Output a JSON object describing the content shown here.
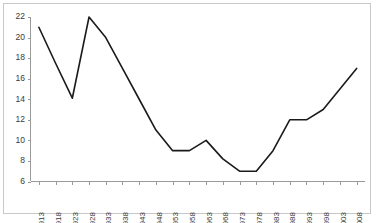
{
  "chart_data": {
    "type": "line",
    "title": "",
    "subtitle": "",
    "xlabel": "",
    "ylabel": "",
    "grid": false,
    "legend": false,
    "legend_position": "none",
    "line_color": "#1a1a1a",
    "axis_color": "#9a9a9a",
    "border_color": "#c8c8c8",
    "background_color": "#ffffff",
    "xlim": [
      1913,
      2008
    ],
    "ylim": [
      6,
      22
    ],
    "ytick_values": [
      6,
      8,
      10,
      12,
      14,
      16,
      18,
      20,
      22
    ],
    "ytick_labels": [
      "6",
      "8",
      "10",
      "12",
      "14",
      "16",
      "18",
      "20",
      "22"
    ],
    "categories": [
      1913,
      1918,
      1923,
      1928,
      1933,
      1938,
      1943,
      1948,
      1953,
      1958,
      1963,
      1968,
      1973,
      1978,
      1983,
      1988,
      1993,
      1998,
      2003,
      2008
    ],
    "xtick_labels": [
      "1913",
      "1918",
      "1923",
      "1928",
      "1933",
      "1938",
      "1943",
      "1948",
      "1953",
      "1958",
      "1963",
      "1968",
      "1973",
      "1978",
      "1983",
      "1988",
      "1993",
      "1998",
      "2003",
      "2008"
    ],
    "values": [
      21,
      17.5,
      14.1,
      22,
      20,
      17,
      14,
      11,
      9,
      9,
      10,
      8.2,
      7,
      7,
      9,
      12,
      12,
      13,
      15,
      17
    ],
    "series": [
      {
        "name": "",
        "values": [
          21,
          17.5,
          14.1,
          22,
          20,
          17,
          14,
          11,
          9,
          9,
          10,
          8.2,
          7,
          7,
          9,
          12,
          12,
          13,
          15,
          17
        ]
      }
    ],
    "annotations": []
  }
}
